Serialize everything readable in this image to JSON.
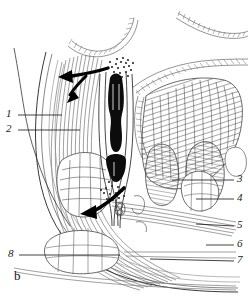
{
  "figure": {
    "panel_letter": "b",
    "kind": "anatomical-line-drawing",
    "background_color": "#ffffff",
    "ink_color": "#1a1a1a"
  },
  "labels": [
    {
      "id": "1",
      "text": "1",
      "x": 6,
      "y": 110,
      "leader": {
        "x1": 18,
        "y1": 115,
        "x2": 62,
        "y2": 115
      }
    },
    {
      "id": "2",
      "text": "2",
      "x": 6,
      "y": 125,
      "leader": {
        "x1": 18,
        "y1": 130,
        "x2": 80,
        "y2": 130
      }
    },
    {
      "id": "3",
      "text": "3",
      "x": 236,
      "y": 175,
      "leader": {
        "x1": 234,
        "y1": 180,
        "x2": 172,
        "y2": 180
      }
    },
    {
      "id": "4",
      "text": "4",
      "x": 236,
      "y": 194,
      "leader": {
        "x1": 234,
        "y1": 199,
        "x2": 196,
        "y2": 199
      }
    },
    {
      "id": "5",
      "text": "5",
      "x": 236,
      "y": 221,
      "leader": {
        "x1": 234,
        "y1": 226,
        "x2": 196,
        "y2": 224
      }
    },
    {
      "id": "6",
      "text": "6",
      "x": 236,
      "y": 240,
      "leader": {
        "x1": 234,
        "y1": 245,
        "x2": 206,
        "y2": 245
      }
    },
    {
      "id": "7",
      "text": "7",
      "x": 236,
      "y": 256,
      "leader": {
        "x1": 234,
        "y1": 261,
        "x2": 150,
        "y2": 259
      }
    },
    {
      "id": "8",
      "text": "8",
      "x": 8,
      "y": 250,
      "leader": {
        "x1": 19,
        "y1": 255,
        "x2": 120,
        "y2": 255
      }
    }
  ],
  "panel_label": {
    "text": "b",
    "x": 14,
    "y": 272
  },
  "arrows": [
    {
      "name": "branching-flow-arrow",
      "x": 58,
      "y": 80,
      "direction": "left-forked"
    },
    {
      "name": "curved-flow-arrow",
      "x": 80,
      "y": 212,
      "direction": "down-left-curved"
    }
  ]
}
